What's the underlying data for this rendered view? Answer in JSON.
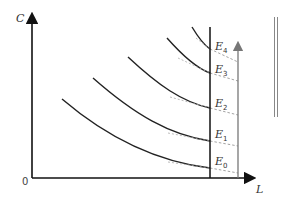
{
  "diagram": {
    "axes": {
      "y_label": "C",
      "x_label": "L",
      "origin_label": "0"
    },
    "curves": [
      {
        "label": "E",
        "subscript": "0",
        "path": "M62,99 C110,140 160,162 210,168"
      },
      {
        "label": "E",
        "subscript": "1",
        "path": "M93,78 C135,115 170,135 210,141"
      },
      {
        "label": "E",
        "subscript": "2",
        "path": "M128,57 C158,85 182,102 210,108"
      },
      {
        "label": "E",
        "subscript": "3",
        "path": "M167,38 C182,55 196,68 210,73"
      },
      {
        "label": "E",
        "subscript": "4",
        "path": "M192,27 C198,37 204,45 210,49"
      }
    ],
    "colors": {
      "axis": "#111111",
      "curve": "#222222",
      "dashed": "#9a9a9a",
      "gray_arrow": "#777777",
      "double_line": "#888888"
    }
  }
}
